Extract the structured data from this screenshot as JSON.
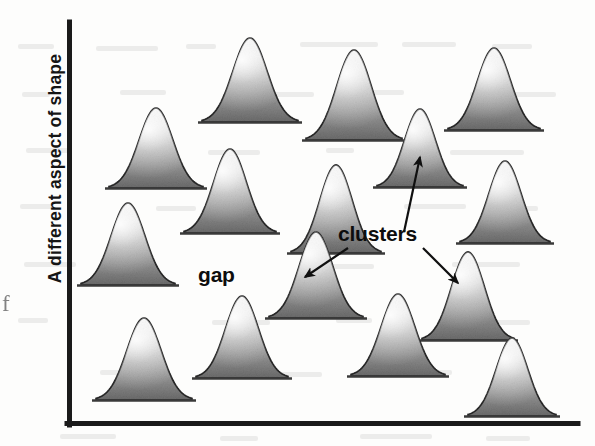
{
  "figure": {
    "type": "schematic-scatter-of-distributions",
    "y_axis_label": "A different aspect of shape",
    "ghost_char": "f",
    "axis_color": "#1a1a1a",
    "bump_fill_light": "#f2f2f2",
    "bump_fill_dark": "#6f6f6f",
    "bump_outline": "#272727"
  },
  "annotations": [
    {
      "id": "gap",
      "text": "gap",
      "x": 198,
      "y": 263
    },
    {
      "id": "clusters",
      "text": "clusters",
      "x": 338,
      "y": 222
    }
  ],
  "arrows": [
    {
      "from_label": "clusters",
      "x1": 404,
      "y1": 232,
      "x2": 420,
      "y2": 157,
      "points_to": "upper-middle-bump"
    },
    {
      "from_label": "clusters",
      "x1": 348,
      "y1": 248,
      "x2": 305,
      "y2": 277,
      "points_to": "cluster-bump-left"
    },
    {
      "from_label": "clusters",
      "x1": 423,
      "y1": 248,
      "x2": 458,
      "y2": 283,
      "points_to": "cluster-bump-right"
    }
  ],
  "chart_data": {
    "type": "scatter",
    "title": "",
    "xlabel": "",
    "ylabel": "A different aspect of shape",
    "xlim": [
      68,
      578
    ],
    "ylim": [
      22,
      424
    ],
    "grid": false,
    "legend": null,
    "marker_style": "gaussian-bump",
    "note": "Each marker is a shaded bell curve drawn at a data location; the scatter shows two clusters separated by a gap.",
    "points": [
      {
        "id": "p1",
        "cx": 156,
        "base_y": 188,
        "width": 94,
        "height": 80,
        "group": "left-group"
      },
      {
        "id": "p2",
        "cx": 250,
        "base_y": 122,
        "width": 96,
        "height": 84,
        "group": "left-group"
      },
      {
        "id": "p3",
        "cx": 354,
        "base_y": 140,
        "width": 96,
        "height": 90,
        "group": "left-group"
      },
      {
        "id": "p4",
        "cx": 494,
        "base_y": 130,
        "width": 92,
        "height": 82,
        "group": "right-group"
      },
      {
        "id": "p5",
        "cx": 420,
        "base_y": 187,
        "width": 86,
        "height": 78,
        "group": "cluster-top"
      },
      {
        "id": "p6",
        "cx": 128,
        "base_y": 285,
        "width": 94,
        "height": 82,
        "group": "left-group"
      },
      {
        "id": "p7",
        "cx": 230,
        "base_y": 233,
        "width": 92,
        "height": 84,
        "group": "left-group"
      },
      {
        "id": "p8",
        "cx": 336,
        "base_y": 253,
        "width": 90,
        "height": 88,
        "group": "left-group"
      },
      {
        "id": "p9",
        "cx": 505,
        "base_y": 243,
        "width": 90,
        "height": 82,
        "group": "right-group"
      },
      {
        "id": "p10",
        "cx": 316,
        "base_y": 318,
        "width": 94,
        "height": 86,
        "group": "cluster-left"
      },
      {
        "id": "p11",
        "cx": 468,
        "base_y": 340,
        "width": 92,
        "height": 88,
        "group": "cluster-right"
      },
      {
        "id": "p12",
        "cx": 144,
        "base_y": 400,
        "width": 96,
        "height": 82,
        "group": "left-group"
      },
      {
        "id": "p13",
        "cx": 242,
        "base_y": 378,
        "width": 92,
        "height": 82,
        "group": "left-group"
      },
      {
        "id": "p14",
        "cx": 398,
        "base_y": 376,
        "width": 94,
        "height": 82,
        "group": "left-group"
      },
      {
        "id": "p15",
        "cx": 512,
        "base_y": 416,
        "width": 88,
        "height": 78,
        "group": "right-group"
      }
    ]
  }
}
